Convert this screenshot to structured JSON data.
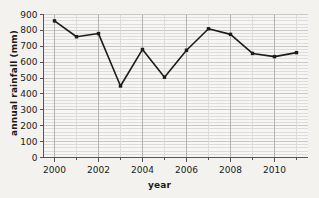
{
  "chart_data": {
    "type": "line",
    "title": "",
    "xlabel": "year",
    "ylabel": "annual rainfall (mm)",
    "x": [
      2000,
      2001,
      2002,
      2003,
      2004,
      2005,
      2006,
      2007,
      2008,
      2009,
      2010,
      2011
    ],
    "values": [
      860,
      760,
      780,
      450,
      680,
      505,
      675,
      810,
      775,
      655,
      635,
      660
    ],
    "series": [
      {
        "name": "annual rainfall",
        "values": [
          860,
          760,
          780,
          450,
          680,
          505,
          675,
          810,
          775,
          655,
          635,
          660
        ]
      }
    ],
    "xlim": [
      1999.5,
      2011.5
    ],
    "ylim": [
      0,
      900
    ],
    "ytick_labels": [
      "0",
      "100",
      "200",
      "300",
      "400",
      "500",
      "600",
      "700",
      "800",
      "900"
    ],
    "ytick_values": [
      0,
      100,
      200,
      300,
      400,
      500,
      600,
      700,
      800,
      900
    ],
    "xtick_labels": [
      "2000",
      "2002",
      "2004",
      "2006",
      "2008",
      "2010"
    ],
    "xtick_values": [
      2000,
      2002,
      2004,
      2006,
      2008,
      2010
    ],
    "xminor_values": [
      2001,
      2003,
      2005,
      2007,
      2009,
      2011
    ],
    "grid": "major and minor horizontal gridlines, vertical gridlines at each year",
    "minor_y_step": 20,
    "legend": "none",
    "marker": "square",
    "line_color": "#1c1c1c",
    "marker_color": "#1c1c1c",
    "grid_color": "#c8c8c8",
    "minor_grid_color": "#dcdcdc",
    "axis_color": "#555555",
    "background_color": "#f3f2ef",
    "plot_background_color": "#f7f6f4"
  }
}
